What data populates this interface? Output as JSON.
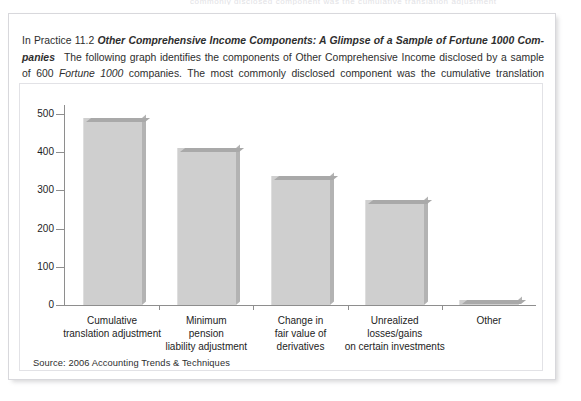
{
  "ghost_text": "commonly disclosed component was the cumulative translation adjustment",
  "panel": {
    "intro": {
      "label": "In Practice 11.2",
      "title": "Other Comprehensive Income Components: A Glimpse of a Sample of Fortune 1000 Com-",
      "title_cont": "panies",
      "body_1": "The following graph identifies the components of Other Comprehensive Income disclosed by a sample of 600",
      "body_italic": "Fortune 1000",
      "body_2": "companies. The most commonly disclosed component was the cumulative translation adjustment:"
    },
    "source": "Source: 2006 Accounting Trends & Techniques"
  },
  "chart_data": {
    "type": "bar",
    "title": "",
    "xlabel": "",
    "ylabel": "",
    "ylim": [
      0,
      500
    ],
    "yticks": [
      0,
      100,
      200,
      300,
      400,
      500
    ],
    "ytick_labels": [
      "0",
      "100",
      "200",
      "300",
      "400",
      "500"
    ],
    "grid": false,
    "legend": "none",
    "categories": [
      "Cumulative translation adjustment",
      "Minimum pension liability adjustment",
      "Change in fair value of derivatives",
      "Unrealized losses/gains on certain investments",
      "Other"
    ],
    "category_lines": [
      [
        "Cumulative",
        "translation adjustment"
      ],
      [
        "Minimum",
        "pension",
        "liability adjustment"
      ],
      [
        "Change in",
        "fair value of",
        "derivatives"
      ],
      [
        "Unrealized",
        "losses/gains",
        "on certain investments"
      ],
      [
        "Other"
      ]
    ],
    "values": [
      490,
      412,
      337,
      274,
      13
    ],
    "bar_color": "#cfcfcf",
    "bar_top_color": "#a9a9a9",
    "bar_side_color": "#b3b3b3"
  }
}
